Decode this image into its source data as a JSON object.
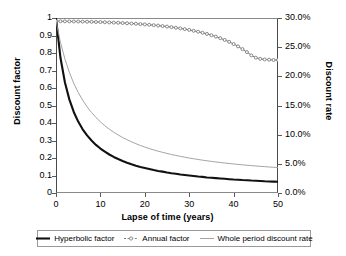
{
  "chart_data": {
    "type": "line",
    "title": "",
    "xlabel": "Lapse of time (years)",
    "ylabel": "Discount factor",
    "y2label": "Discount rate",
    "xlim": [
      0,
      50
    ],
    "ylim": [
      0,
      1
    ],
    "y2lim": [
      0,
      0.3
    ],
    "grid": false,
    "legend_position": "bottom",
    "x_ticks": [
      0,
      10,
      20,
      30,
      40,
      50
    ],
    "x_tick_labels": [
      "0",
      "10",
      "20",
      "30",
      "40",
      "50"
    ],
    "y_ticks": [
      0,
      0.1,
      0.2,
      0.3,
      0.4,
      0.5,
      0.6,
      0.7,
      0.8,
      0.9,
      1
    ],
    "y_tick_labels": [
      "0",
      "0.1",
      "0.2",
      "0.3",
      "0.4",
      "0.5",
      "0.6",
      "0.7",
      "0.8",
      "0.9",
      "1"
    ],
    "y2_ticks": [
      0.0,
      0.05,
      0.1,
      0.15,
      0.2,
      0.25,
      0.3
    ],
    "y2_tick_labels": [
      "0.0%",
      "5.0%",
      "10.0%",
      "15.0%",
      "20.0%",
      "25.0%",
      "30.0%"
    ],
    "x": [
      0,
      1,
      2,
      3,
      4,
      5,
      6,
      7,
      8,
      9,
      10,
      11,
      12,
      13,
      14,
      15,
      16,
      17,
      18,
      19,
      20,
      21,
      22,
      23,
      24,
      25,
      26,
      27,
      28,
      29,
      30,
      31,
      32,
      33,
      34,
      35,
      36,
      37,
      38,
      39,
      40,
      41,
      42,
      43,
      44,
      45,
      46,
      47,
      48,
      49,
      50
    ],
    "series": [
      {
        "name": "Hyperbolic factor",
        "axis": "left",
        "color": "#111111",
        "width": 2.1,
        "marker": "none",
        "values": [
          1.0,
          0.774,
          0.633,
          0.535,
          0.463,
          0.408,
          0.364,
          0.329,
          0.3,
          0.275,
          0.254,
          0.236,
          0.22,
          0.206,
          0.194,
          0.183,
          0.173,
          0.164,
          0.156,
          0.149,
          0.143,
          0.137,
          0.131,
          0.126,
          0.122,
          0.117,
          0.113,
          0.11,
          0.106,
          0.103,
          0.1,
          0.097,
          0.094,
          0.092,
          0.089,
          0.087,
          0.085,
          0.083,
          0.081,
          0.079,
          0.077,
          0.076,
          0.074,
          0.073,
          0.071,
          0.07,
          0.069,
          0.067,
          0.066,
          0.065,
          0.064
        ]
      },
      {
        "name": "Annual factor",
        "axis": "right",
        "color": "#6e6e6e",
        "width": 0.9,
        "marker": "open-circle",
        "values": [
          0.2945,
          0.2944,
          0.2943,
          0.2942,
          0.2941,
          0.294,
          0.2938,
          0.2936,
          0.2934,
          0.2932,
          0.293,
          0.2927,
          0.2924,
          0.2921,
          0.2918,
          0.2914,
          0.291,
          0.2906,
          0.2901,
          0.2896,
          0.289,
          0.2884,
          0.2877,
          0.287,
          0.2862,
          0.2853,
          0.2844,
          0.2833,
          0.2822,
          0.281,
          0.2796,
          0.2781,
          0.2765,
          0.2747,
          0.2727,
          0.2705,
          0.2681,
          0.2654,
          0.2624,
          0.2591,
          0.2554,
          0.2513,
          0.2467,
          0.2416,
          0.2359,
          0.232,
          0.23,
          0.229,
          0.2285,
          0.228,
          0.228
        ]
      },
      {
        "name": "Whole period discount rate",
        "axis": "right",
        "color": "#9a9a9a",
        "width": 0.9,
        "marker": "none",
        "values": [
          0.2945,
          0.2585,
          0.23,
          0.207,
          0.188,
          0.1725,
          0.1592,
          0.1478,
          0.138,
          0.1295,
          0.122,
          0.1154,
          0.1095,
          0.1042,
          0.0995,
          0.0952,
          0.0913,
          0.0878,
          0.0845,
          0.0815,
          0.0788,
          0.0762,
          0.0739,
          0.0717,
          0.0697,
          0.0678,
          0.066,
          0.0644,
          0.0628,
          0.0614,
          0.06,
          0.0587,
          0.0575,
          0.0563,
          0.0552,
          0.0542,
          0.0532,
          0.0523,
          0.0514,
          0.0506,
          0.0498,
          0.049,
          0.0483,
          0.0476,
          0.047,
          0.0463,
          0.0457,
          0.0452,
          0.0446,
          0.0441,
          0.0436
        ]
      }
    ]
  },
  "legend": {
    "items": [
      {
        "label": "Hyperbolic factor",
        "marker": "thick-line"
      },
      {
        "label": "Annual factor",
        "marker": "dotted-line-circle"
      },
      {
        "label": "Whole period discount rate",
        "marker": "thin-line"
      }
    ]
  }
}
